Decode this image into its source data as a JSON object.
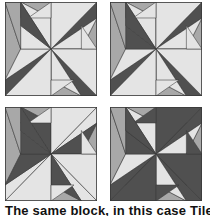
{
  "figure": {
    "colors": {
      "light": "#e4e4e4",
      "medium": "#a8a8a8",
      "dark": "#505050",
      "line": "#3a3a3a"
    },
    "blocks": [
      {
        "name": "variation-1",
        "x": 5,
        "y": 2,
        "scheme": [
          "dark",
          "light",
          "medium",
          "light",
          "light",
          "medium",
          "dark",
          "light"
        ]
      },
      {
        "name": "variation-2",
        "x": 110,
        "y": 2,
        "scheme": [
          "dark",
          "light",
          "medium",
          "light",
          "dark",
          "medium",
          "dark",
          "light"
        ]
      },
      {
        "name": "variation-3",
        "x": 5,
        "y": 107,
        "scheme": [
          "light",
          "light",
          "medium",
          "dark",
          "dark",
          "medium",
          "dark",
          "light"
        ]
      },
      {
        "name": "variation-4",
        "x": 110,
        "y": 107,
        "scheme": [
          "dark",
          "dark",
          "medium",
          "light",
          "dark",
          "medium",
          "dark",
          "dark"
        ]
      }
    ]
  },
  "caption": "The same block, in this case Tile"
}
